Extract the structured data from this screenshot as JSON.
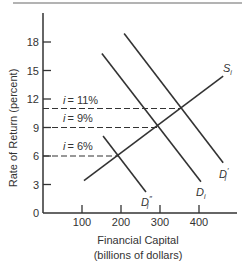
{
  "chart_data": {
    "type": "line",
    "title": "",
    "xlabel": "Financial Capital",
    "xlabel_sub": "(billions of dollars)",
    "ylabel": "Rate of Return (percent)",
    "xlim": [
      0,
      500
    ],
    "ylim": [
      0,
      20
    ],
    "x_ticks": [
      100,
      200,
      300,
      400
    ],
    "y_ticks": [
      0,
      3,
      6,
      9,
      12,
      15,
      18
    ],
    "grid": false,
    "series": [
      {
        "name": "S_i",
        "label_main": "S",
        "label_sub": "i",
        "label_prime": "",
        "points": [
          [
            105,
            3.4
          ],
          [
            462,
            14.4
          ]
        ]
      },
      {
        "name": "D_i",
        "label_main": "D",
        "label_sub": "i",
        "label_prime": "",
        "points": [
          [
            151,
            16.8
          ],
          [
            405,
            3.3
          ]
        ]
      },
      {
        "name": "D'_i",
        "label_main": "D",
        "label_sub": "i",
        "label_prime": "′",
        "points": [
          [
            208,
            18.9
          ],
          [
            462,
            5.3
          ]
        ]
      },
      {
        "name": "D''_i",
        "label_main": "D",
        "label_sub": "i",
        "label_prime": "″",
        "points": [
          [
            154,
            8.1
          ],
          [
            264,
            2.2
          ]
        ]
      }
    ],
    "annotations": [
      {
        "text": "i = 11%",
        "i_symbol": "i",
        "value_text": "= 11%",
        "y": 11,
        "x_end": 355
      },
      {
        "text": "i = 9%",
        "i_symbol": "i",
        "value_text": "= 9%",
        "y": 9,
        "x_end": 293
      },
      {
        "text": "i = 6%",
        "i_symbol": "i",
        "value_text": "= 6%",
        "y": 6,
        "x_end": 195
      }
    ]
  },
  "axes": {
    "y_tick_labels": [
      "0",
      "3",
      "6",
      "9",
      "12",
      "15",
      "18"
    ],
    "x_tick_labels": [
      "100",
      "200",
      "300",
      "400"
    ]
  }
}
